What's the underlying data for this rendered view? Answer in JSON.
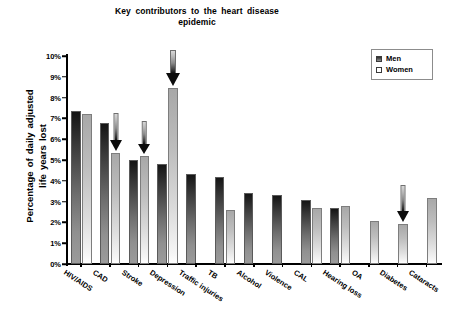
{
  "chart_data": {
    "type": "bar",
    "title": "Key contributors to the heart disease epidemic",
    "title_line1": "Key contributors to the heart disease",
    "title_line2": "epidemic",
    "xlabel": "",
    "ylabel": "Percentage of daily adjusted life years lost",
    "ylabel_line1": "Percentage of daily adjusted",
    "ylabel_line2": "life years lost",
    "ylim": [
      0,
      10
    ],
    "ytick_labels": [
      "0%",
      "1%",
      "2%",
      "3%",
      "4%",
      "5%",
      "6%",
      "7%",
      "8%",
      "9%",
      "10%"
    ],
    "ytick_values": [
      0,
      1,
      2,
      3,
      4,
      5,
      6,
      7,
      8,
      9,
      10
    ],
    "grid": false,
    "legend_position": "top-right",
    "categories": [
      "HIV/AIDS",
      "CAD",
      "Stroke",
      "Depression",
      "Traffic injuries",
      "TB",
      "Alcohol",
      "Violence",
      "CAL",
      "Hearing loss",
      "OA",
      "Diabetes",
      "Cataracts"
    ],
    "series": [
      {
        "name": "Men",
        "values": [
          7.35,
          6.8,
          5.0,
          4.8,
          4.35,
          4.2,
          3.4,
          3.3,
          3.1,
          2.7,
          null,
          null,
          null
        ]
      },
      {
        "name": "Women",
        "values": [
          7.2,
          5.35,
          5.2,
          8.45,
          null,
          2.6,
          null,
          null,
          2.7,
          2.8,
          2.05,
          1.9,
          3.15
        ]
      }
    ],
    "annotations": [
      {
        "name": "arrow-cad-women",
        "category": "CAD",
        "series": "Women",
        "points_to": 5.35,
        "direction": "down"
      },
      {
        "name": "arrow-stroke-women",
        "category": "Stroke",
        "series": "Women",
        "points_to": 5.2,
        "direction": "down"
      },
      {
        "name": "arrow-depression-women",
        "category": "Depression",
        "series": "Women",
        "points_to": 8.45,
        "direction": "down"
      },
      {
        "name": "arrow-diabetes-women",
        "category": "Diabetes",
        "series": "Women",
        "points_to": 1.9,
        "direction": "down"
      }
    ],
    "colors": {
      "men_bar_top": "#151515",
      "men_bar_bottom": "#9b9b9b",
      "women_bar_top": "#a8a8a8",
      "women_bar_bottom": "#ffffff",
      "axis": "#000000",
      "arrow": "#111111",
      "background": "#ffffff"
    }
  },
  "legend": {
    "items": [
      {
        "label": "Men"
      },
      {
        "label": "Women"
      }
    ]
  }
}
